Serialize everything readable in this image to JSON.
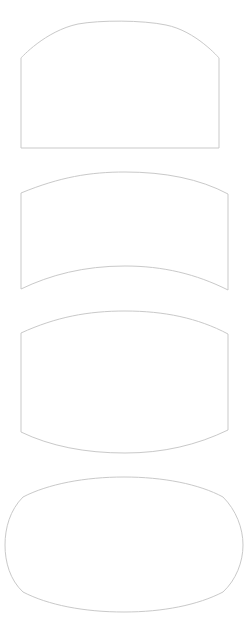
{
  "canvas": {
    "width": 249,
    "height": 626,
    "background_color": "#ffffff",
    "title": "Shape Outlines",
    "description": "Four thin gray outlined vector shapes stacked vertically on a white background"
  },
  "style": {
    "stroke_color": "#c9c9c9",
    "stroke_color_alt": "#d2d2d2",
    "stroke_width": 1,
    "fill": "none"
  },
  "shapes": [
    {
      "id": "shape-1",
      "name": "arched-panel",
      "label": "Arched panel",
      "stroke": "#c9c9c9",
      "stroke_width": 1,
      "fill": "none",
      "bounds": {
        "x": 21,
        "y": 22,
        "width": 198,
        "height": 126
      },
      "path": "M 21,58 C 21,58 45,31 78,24 C 100,20 142,20 166,25 C 196,31 219,58 219,58 L 219,148 L 21,148 Z"
    },
    {
      "id": "shape-2",
      "name": "curved-band",
      "label": "Curved band",
      "stroke": "#c9c9c9",
      "stroke_width": 1,
      "fill": "none",
      "bounds": {
        "x": 21,
        "y": 172,
        "width": 207,
        "height": 117
      },
      "path": "M 21,193 C 60,177 90,172 125,172 C 165,172 200,179 228,194 L 228,290 C 196,274 163,266 125,266 C 84,266 50,275 21,289 Z"
    },
    {
      "id": "shape-3",
      "name": "lens-shape",
      "label": "Lens shape",
      "stroke": "#c9c9c9",
      "stroke_width": 1,
      "fill": "none",
      "bounds": {
        "x": 21,
        "y": 311,
        "width": 207,
        "height": 142
      },
      "path": "M 21,333 C 56,317 88,311 125,311 C 164,311 198,318 228,334 L 228,430 C 197,445 163,453 125,453 C 85,453 50,446 21,432 Z"
    },
    {
      "id": "shape-4",
      "name": "rounded-oval",
      "label": "Rounded oval",
      "stroke": "#c9c9c9",
      "stroke_width": 1,
      "fill": "none",
      "bounds": {
        "x": 5,
        "y": 477,
        "width": 238,
        "height": 135
      },
      "path": "M 23,497 C 48,484 85,477 124,477 C 163,477 199,484 223,497 C 236,510 243,528 243,545 C 243,562 236,580 223,592 C 198,605 163,612 124,612 C 84,612 48,605 23,592 C 10,580 5,562 5,545 C 5,528 10,510 23,497 Z"
    }
  ]
}
